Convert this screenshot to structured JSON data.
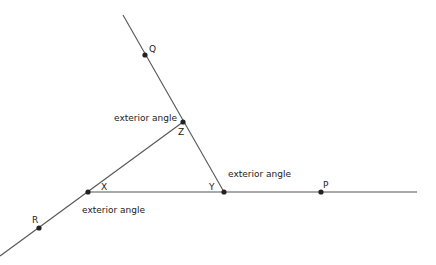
{
  "diagram": {
    "points": {
      "Q": {
        "label": "Q",
        "x": 145,
        "y": 55
      },
      "Z": {
        "label": "Z",
        "x": 183,
        "y": 122
      },
      "X": {
        "label": "X",
        "x": 88,
        "y": 192
      },
      "Y": {
        "label": "Y",
        "x": 224,
        "y": 192
      },
      "P": {
        "label": "P",
        "x": 321,
        "y": 192
      },
      "R": {
        "label": "R",
        "x": 39,
        "y": 228
      }
    },
    "annotations": {
      "z_angle": "exterior angle",
      "y_angle": "exterior angle",
      "x_angle": "exterior angle"
    },
    "colors": {
      "line": "#555555",
      "dot": "#222222",
      "text": "#222222",
      "background": "#ffffff"
    }
  }
}
